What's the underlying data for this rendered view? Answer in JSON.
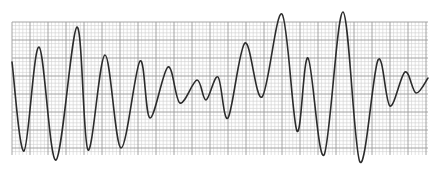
{
  "strip": {
    "description": "ECG rhythm strip with polymorphic waveform twisting around the baseline",
    "background_color": "#ffffff",
    "grid": {
      "x0": 12,
      "y0": 22,
      "x1": 428,
      "y1": 155,
      "minor_spacing": 3.6,
      "major_every": 5,
      "minor_color": "#cfcfcf",
      "major_color": "#9a9a9a"
    },
    "trace": {
      "color": "#2b2b2b",
      "width": 1.6,
      "points": [
        [
          12,
          62
        ],
        [
          24,
          151
        ],
        [
          39,
          47
        ],
        [
          56,
          160
        ],
        [
          77,
          27
        ],
        [
          88,
          150
        ],
        [
          105,
          55
        ],
        [
          121,
          148
        ],
        [
          140,
          61
        ],
        [
          150,
          118
        ],
        [
          168,
          67
        ],
        [
          180,
          103
        ],
        [
          197,
          80
        ],
        [
          206,
          100
        ],
        [
          218,
          77
        ],
        [
          228,
          118
        ],
        [
          245,
          43
        ],
        [
          262,
          97
        ],
        [
          282,
          14
        ],
        [
          297,
          131
        ],
        [
          308,
          58
        ],
        [
          324,
          155
        ],
        [
          343,
          12
        ],
        [
          360,
          162
        ],
        [
          378,
          60
        ],
        [
          390,
          106
        ],
        [
          405,
          72
        ],
        [
          416,
          93
        ],
        [
          428,
          78
        ]
      ]
    }
  }
}
